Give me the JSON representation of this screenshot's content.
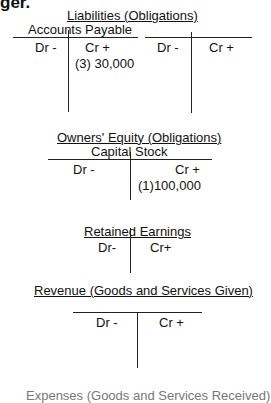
{
  "page": {
    "top_heading_fragment": "ger."
  },
  "liabilities": {
    "title": "Liabilities (Obligations)",
    "accounts": [
      {
        "name": "Accounts Payable",
        "debit_label": "Dr -",
        "credit_label": "Cr +",
        "credit_entries": [
          "(3) 30,000"
        ],
        "debit_entries": []
      },
      {
        "name": "",
        "debit_label": "Dr -",
        "credit_label": "Cr +",
        "credit_entries": [],
        "debit_entries": []
      }
    ]
  },
  "owners_equity": {
    "title": "Owners' Equity (Obligations)",
    "accounts": [
      {
        "name": "Capital Stock",
        "debit_label": "Dr -",
        "credit_label": "Cr +",
        "credit_entries": [
          "(1)100,000"
        ],
        "debit_entries": []
      },
      {
        "name": "Retained Earnings",
        "debit_label": "Dr-",
        "credit_label": "Cr+",
        "credit_entries": [],
        "debit_entries": []
      }
    ]
  },
  "revenue": {
    "title": "Revenue (Goods and Services Given)",
    "accounts": [
      {
        "name": "",
        "debit_label": "Dr -",
        "credit_label": "Cr +",
        "credit_entries": [],
        "debit_entries": []
      }
    ]
  },
  "expenses": {
    "title": "Expenses (Goods and Services Received)"
  }
}
